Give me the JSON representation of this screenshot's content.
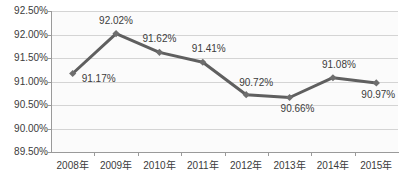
{
  "chart_data": {
    "type": "line",
    "title": "",
    "xlabel": "",
    "ylabel": "",
    "categories": [
      "2008年",
      "2009年",
      "2010年",
      "2011年",
      "2012年",
      "2013年",
      "2014年",
      "2015年"
    ],
    "values": [
      91.17,
      92.02,
      91.62,
      91.41,
      90.72,
      90.66,
      91.08,
      90.97
    ],
    "point_labels": [
      "91.17%",
      "92.02%",
      "91.62%",
      "91.41%",
      "90.72%",
      "90.66%",
      "91.08%",
      "90.97%"
    ],
    "ylim": [
      89.5,
      92.5
    ],
    "ytick_step": 0.5,
    "ytick_labels": [
      "92.50%",
      "92.00%",
      "91.50%",
      "91.00%",
      "90.50%",
      "90.00%",
      "89.50%"
    ],
    "ytick_values": [
      92.5,
      92.0,
      91.5,
      91.0,
      90.5,
      90.0,
      89.5
    ],
    "grid": true,
    "legend": "none",
    "series_color": "#5f5f5f",
    "marker_color": "#6e6e6e",
    "marker_shape": "diamond",
    "gridline_color": "#d4d4d4",
    "axis_color": "#9a9a9a",
    "text_color": "#3b3b3b",
    "plot_background": "#fbfbfb"
  }
}
